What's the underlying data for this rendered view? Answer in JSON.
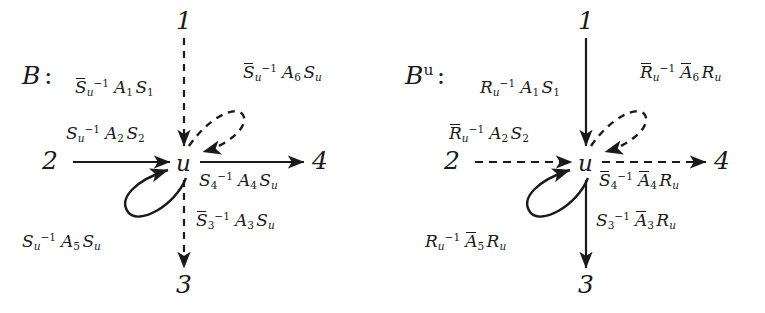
{
  "figure": {
    "type": "commutative-diagram-pair",
    "background": "#ffffff",
    "ink": "#1a1a1a",
    "panels": [
      {
        "id": "left",
        "title": "B",
        "title_sup": "",
        "title_colon": ":",
        "vertical_edge_style": "dashed",
        "horizontal_edge_style": "solid",
        "loop_solid_style": "solid",
        "loop_dashed_style": "dashed",
        "nodes": {
          "top": "1",
          "left": "2",
          "bottom": "3",
          "right": "4",
          "center": "u"
        },
        "edges": [
          {
            "name": "edge-1-to-u",
            "from": "1",
            "to": "u",
            "direction": "down",
            "style": "dashed",
            "label": {
              "pre": "S",
              "pre_bar": true,
              "pre_sub": "u",
              "pre_sup": "-1",
              "mid": "A",
              "mid_bar": false,
              "mid_sub": "1",
              "post": "S",
              "post_bar": false,
              "post_sub": "1"
            },
            "label_plain": "S̄u⁻¹ A₁ S₁"
          },
          {
            "name": "edge-2-to-u",
            "from": "2",
            "to": "u",
            "direction": "right",
            "style": "solid",
            "label": {
              "pre": "S",
              "pre_bar": false,
              "pre_sub": "u",
              "pre_sup": "-1",
              "mid": "A",
              "mid_bar": false,
              "mid_sub": "2",
              "post": "S",
              "post_bar": false,
              "post_sub": "2"
            },
            "label_plain": "Su⁻¹ A₂ S₂"
          },
          {
            "name": "edge-u-to-3",
            "from": "u",
            "to": "3",
            "direction": "down",
            "style": "dashed",
            "label": {
              "pre": "S",
              "pre_bar": true,
              "pre_sub": "3",
              "pre_sup": "-1",
              "mid": "A",
              "mid_bar": false,
              "mid_sub": "3",
              "post": "S",
              "post_bar": false,
              "post_sub": "u"
            },
            "label_plain": "S̄3⁻¹ A₃ Su"
          },
          {
            "name": "edge-u-to-4",
            "from": "u",
            "to": "4",
            "direction": "right",
            "style": "solid",
            "label": {
              "pre": "S",
              "pre_bar": false,
              "pre_sub": "4",
              "pre_sup": "-1",
              "mid": "A",
              "mid_bar": false,
              "mid_sub": "4",
              "post": "S",
              "post_bar": false,
              "post_sub": "u"
            },
            "label_plain": "S4⁻¹ A₄ Su"
          },
          {
            "name": "loop-solid-lower-left",
            "from": "u",
            "to": "u",
            "direction": "loop",
            "style": "solid",
            "label": {
              "pre": "S",
              "pre_bar": false,
              "pre_sub": "u",
              "pre_sup": "-1",
              "mid": "A",
              "mid_bar": false,
              "mid_sub": "5",
              "post": "S",
              "post_bar": false,
              "post_sub": "u"
            },
            "label_plain": "Su⁻¹ A₅ Su"
          },
          {
            "name": "loop-dashed-upper-right",
            "from": "u",
            "to": "u",
            "direction": "loop",
            "style": "dashed",
            "label": {
              "pre": "S",
              "pre_bar": true,
              "pre_sub": "u",
              "pre_sup": "-1",
              "mid": "A",
              "mid_bar": false,
              "mid_sub": "6",
              "post": "S",
              "post_bar": false,
              "post_sub": "u"
            },
            "label_plain": "S̄u⁻¹ A₆ Su"
          }
        ]
      },
      {
        "id": "right",
        "title": "B",
        "title_sup": "u",
        "title_colon": ":",
        "vertical_edge_style": "solid",
        "horizontal_edge_style": "dashed",
        "loop_solid_style": "solid",
        "loop_dashed_style": "dashed",
        "nodes": {
          "top": "1",
          "left": "2",
          "bottom": "3",
          "right": "4",
          "center": "u"
        },
        "edges": [
          {
            "name": "edge-1-to-u",
            "from": "1",
            "to": "u",
            "direction": "down",
            "style": "solid",
            "label": {
              "pre": "R",
              "pre_bar": false,
              "pre_sub": "u",
              "pre_sup": "-1",
              "mid": "A",
              "mid_bar": false,
              "mid_sub": "1",
              "post": "S",
              "post_bar": false,
              "post_sub": "1"
            },
            "label_plain": "Ru⁻¹ A₁ S₁"
          },
          {
            "name": "edge-2-to-u",
            "from": "2",
            "to": "u",
            "direction": "right",
            "style": "dashed",
            "label": {
              "pre": "R",
              "pre_bar": true,
              "pre_sub": "u",
              "pre_sup": "-1",
              "mid": "A",
              "mid_bar": false,
              "mid_sub": "2",
              "post": "S",
              "post_bar": false,
              "post_sub": "2"
            },
            "label_plain": "R̄u⁻¹ A₂ S₂"
          },
          {
            "name": "edge-u-to-3",
            "from": "u",
            "to": "3",
            "direction": "down",
            "style": "solid",
            "label": {
              "pre": "S",
              "pre_bar": false,
              "pre_sub": "3",
              "pre_sup": "-1",
              "mid": "A",
              "mid_bar": true,
              "mid_sub": "3",
              "post": "R",
              "post_bar": false,
              "post_sub": "u"
            },
            "label_plain": "S3⁻¹ Ā₃ Ru"
          },
          {
            "name": "edge-u-to-4",
            "from": "u",
            "to": "4",
            "direction": "right",
            "style": "dashed",
            "label": {
              "pre": "S",
              "pre_bar": true,
              "pre_sub": "4",
              "pre_sup": "-1",
              "mid": "A",
              "mid_bar": true,
              "mid_sub": "4",
              "post": "R",
              "post_bar": false,
              "post_sub": "u"
            },
            "label_plain": "S̄4⁻¹ Ā₄ Ru"
          },
          {
            "name": "loop-solid-lower-left",
            "from": "u",
            "to": "u",
            "direction": "loop",
            "style": "solid",
            "label": {
              "pre": "R",
              "pre_bar": false,
              "pre_sub": "u",
              "pre_sup": "-1",
              "mid": "A",
              "mid_bar": true,
              "mid_sub": "5",
              "post": "R",
              "post_bar": false,
              "post_sub": "u"
            },
            "label_plain": "Ru⁻¹ Ā₅ Ru"
          },
          {
            "name": "loop-dashed-upper-right",
            "from": "u",
            "to": "u",
            "direction": "loop",
            "style": "dashed",
            "label": {
              "pre": "R",
              "pre_bar": true,
              "pre_sub": "u",
              "pre_sup": "-1",
              "mid": "A",
              "mid_bar": true,
              "mid_sub": "6",
              "post": "R",
              "post_bar": false,
              "post_sub": "u"
            },
            "label_plain": "R̄u⁻¹ Ā₆ Ru"
          }
        ]
      }
    ]
  }
}
